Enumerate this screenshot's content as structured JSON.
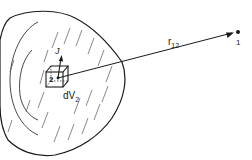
{
  "diagram": {
    "labels": {
      "current_density": "J",
      "point_source": "2",
      "volume_element": "dV",
      "volume_element_sub": "2",
      "distance": "r",
      "distance_sub": "12",
      "field_point": "1"
    },
    "colors": {
      "stroke": "#1a1a1a",
      "background": "#ffffff"
    }
  }
}
